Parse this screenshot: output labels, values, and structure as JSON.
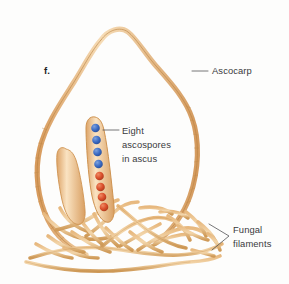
{
  "figure": {
    "panel_letter": "f.",
    "background_color": "#fdfdfc"
  },
  "labels": [
    {
      "id": "ascocarp",
      "text": "Ascocarp",
      "x": 212,
      "y": 74,
      "leader": "M 192 71 L 208 71",
      "target": "ascocarp-wall"
    },
    {
      "id": "eight-ascospores-in-ascus",
      "line1": "Eight",
      "line2": "ascospores",
      "line3": "in ascus",
      "x": 122,
      "y": 134,
      "leader": "M 103 130 L 119 130",
      "target": "ascus-with-spores"
    },
    {
      "id": "fungal-filaments",
      "line1": "Fungal",
      "line2": "filaments",
      "x": 233,
      "y": 233,
      "leader": "M 209 224 L 229 236 L 212 250",
      "target": "fungal-filaments"
    }
  ],
  "structures": {
    "ascocarp": {
      "name": "Ascocarp",
      "description": "flask-shaped outer wall",
      "wall_color": "#e3b47e",
      "wall_fill": "#f0cfa4",
      "wall_outline": "#c38a4e"
    },
    "ascus_with_spores": {
      "name": "Ascus containing eight ascospores",
      "body_fill": "#f7dcb4",
      "body_outline": "#cf9452",
      "spore_count": 8,
      "spores": [
        {
          "index": 1,
          "color": "#3b6bc4",
          "type": "blue"
        },
        {
          "index": 2,
          "color": "#3b6bc4",
          "type": "blue"
        },
        {
          "index": 3,
          "color": "#3b6bc4",
          "type": "blue"
        },
        {
          "index": 4,
          "color": "#3b6bc4",
          "type": "blue"
        },
        {
          "index": 5,
          "color": "#d94d2a",
          "type": "red"
        },
        {
          "index": 6,
          "color": "#d94d2a",
          "type": "red"
        },
        {
          "index": 7,
          "color": "#d94d2a",
          "type": "red"
        },
        {
          "index": 8,
          "color": "#d94d2a",
          "type": "red"
        }
      ]
    },
    "empty_ascus": {
      "name": "Immature ascus",
      "body_fill": "#f5d6a9",
      "body_outline": "#cf9452"
    },
    "fungal_filaments": {
      "name": "Fungal filaments",
      "description": "tangled hyphae at base of ascocarp",
      "color": "#e0ab72",
      "outline": "#c1873f"
    }
  }
}
